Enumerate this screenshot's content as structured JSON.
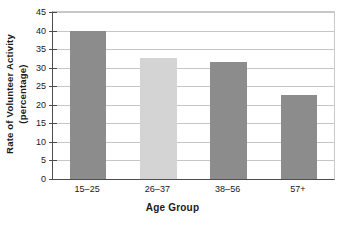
{
  "chart_data": {
    "type": "bar",
    "title": "",
    "categories": [
      "15–25",
      "26–37",
      "38–56",
      "57+"
    ],
    "values": [
      40,
      32.7,
      31.4,
      22.7
    ],
    "bar_colors": [
      "#8c8c8c",
      "#d4d4d4",
      "#8c8c8c",
      "#8c8c8c"
    ],
    "xlabel": "Age Group",
    "ylabel_line1": "Rate of Volunteer Activity",
    "ylabel_line2": "(percentage)",
    "ylim": [
      0,
      45
    ],
    "ytick_values": [
      0,
      5,
      10,
      15,
      20,
      25,
      30,
      35,
      40,
      45
    ],
    "ytick_labels": [
      "0",
      "5",
      "10",
      "15",
      "20",
      "25",
      "30",
      "35",
      "40",
      "45"
    ],
    "grid": true,
    "grid_axis": "y",
    "legend": "none",
    "grid_color": "#c6c6c6",
    "axis_color": "#4d4d4d",
    "background": "#ffffff"
  }
}
